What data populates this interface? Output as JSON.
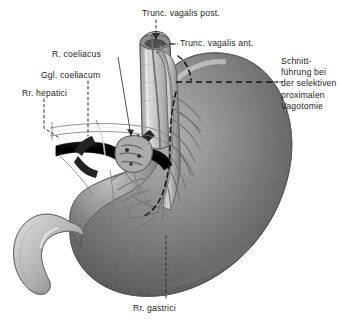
{
  "figure": {
    "language": "de",
    "style": "grayscale anatomical line-and-wash illustration",
    "width": 338,
    "height": 323,
    "background_color": "#ffffff"
  },
  "labels": {
    "trunc_vagalis_post": "Trunc. vagalis post.",
    "trunc_vagalis_ant": "Trunc. vagalis ant.",
    "r_coeliacus": "R. coeliacus",
    "ggl_coeliacum": "Ggl. coeliacum",
    "rr_hepatici": "Rr. hepatici",
    "rr_gastrici": "Rr. gastrici",
    "schnittfuehrung": "Schnitt-\nführung\nbei der\nselektiven\nproximalen\nVagotomie"
  },
  "colors": {
    "ink": "#1d1d1d",
    "organ_mid": "#b4b4b4",
    "organ_dark": "#8e8e8e",
    "organ_light": "#dedede",
    "artery_dark": "#2a2a2a",
    "nerve_line": "#6b6b6b",
    "leader_line": "#3a3a3a",
    "cut_line": "#1a1a1a"
  },
  "structures": [
    {
      "name": "stomach-fundus-corpus",
      "note": "large shaded gastric body, greater curvature to the right"
    },
    {
      "name": "oesophagus",
      "note": "cut tube at top centre with open lumen"
    },
    {
      "name": "duodenum",
      "note": "hooked pale tube at lower left"
    },
    {
      "name": "anterior-vagal-trunk",
      "note": "nerve cord descending on the oesophagus"
    },
    {
      "name": "posterior-vagal-trunk",
      "note": "nerve cord behind the oesophagus"
    },
    {
      "name": "celiac-ganglion",
      "note": "nodular plexus around the celiac trunk"
    },
    {
      "name": "hepatic-artery",
      "note": "dark horizontal vessel to the left"
    },
    {
      "name": "splenic-artery",
      "note": "dark horizontal vessel to the right"
    },
    {
      "name": "gastric-nerve-branches",
      "note": "fine nerve twigs fanning onto the lesser curvature"
    },
    {
      "name": "resection-cut-line",
      "note": "dashed line marking the plane of division"
    }
  ]
}
